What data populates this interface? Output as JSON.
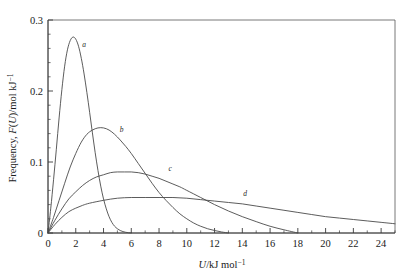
{
  "chart_data": {
    "type": "line",
    "title": "",
    "xlabel": "U/kJ mol⁻¹",
    "ylabel": "Frequency, F(U)/mol kJ⁻¹",
    "xlim": [
      0,
      25
    ],
    "ylim": [
      0,
      0.3
    ],
    "grid": false,
    "legend_position": "inline-curve-labels",
    "x_ticks": [
      0,
      2,
      4,
      6,
      8,
      10,
      12,
      14,
      16,
      18,
      20,
      22,
      24
    ],
    "x_tick_labels": [
      "0",
      "2",
      "4",
      "6",
      "8",
      "10",
      "12",
      "14",
      "16",
      "18",
      "20",
      "22",
      "24"
    ],
    "x_minor_tick_step": 1,
    "y_ticks": [
      0,
      0.1,
      0.2,
      0.3
    ],
    "y_tick_labels": [
      "0",
      "0.1",
      "0.2",
      "0.3"
    ],
    "y_minor_tick_step": 0.02,
    "series": [
      {
        "name": "a",
        "label": "a",
        "label_x": 2.6,
        "label_y": 0.262,
        "peak_x": 1.8,
        "peak_y": 0.276,
        "x": [
          0,
          0.2,
          0.4,
          0.6,
          0.8,
          1.0,
          1.2,
          1.4,
          1.6,
          1.8,
          2.0,
          2.2,
          2.4,
          2.6,
          2.8,
          3.0,
          3.2,
          3.4,
          3.6,
          3.8,
          4.0,
          4.2,
          4.4,
          4.6,
          4.8,
          5.0,
          5.2,
          5.4,
          5.6,
          5.8,
          6.0
        ],
        "y": [
          0.0,
          0.035,
          0.075,
          0.118,
          0.162,
          0.202,
          0.235,
          0.258,
          0.271,
          0.276,
          0.273,
          0.263,
          0.246,
          0.224,
          0.198,
          0.17,
          0.141,
          0.113,
          0.088,
          0.066,
          0.048,
          0.034,
          0.023,
          0.015,
          0.0095,
          0.006,
          0.0035,
          0.002,
          0.001,
          0.0004,
          0.0
        ]
      },
      {
        "name": "b",
        "label": "b",
        "label_x": 5.3,
        "label_y": 0.142,
        "peak_x": 4.0,
        "peak_y": 0.148,
        "x": [
          0,
          0.4,
          0.8,
          1.2,
          1.6,
          2.0,
          2.4,
          2.8,
          3.2,
          3.6,
          4.0,
          4.4,
          4.8,
          5.2,
          5.6,
          6.0,
          6.5,
          7.0,
          7.5,
          8.0,
          8.5,
          9.0,
          9.5,
          10.0,
          10.5,
          11.0,
          11.5,
          12.0,
          12.5,
          13.0
        ],
        "y": [
          0.0,
          0.022,
          0.046,
          0.07,
          0.093,
          0.112,
          0.128,
          0.139,
          0.145,
          0.148,
          0.148,
          0.145,
          0.139,
          0.131,
          0.122,
          0.112,
          0.098,
          0.084,
          0.07,
          0.057,
          0.046,
          0.036,
          0.027,
          0.02,
          0.014,
          0.0095,
          0.006,
          0.0035,
          0.0015,
          0.0
        ]
      },
      {
        "name": "c",
        "label": "c",
        "label_x": 8.8,
        "label_y": 0.088,
        "peak_x": 6.2,
        "peak_y": 0.086,
        "x": [
          0,
          0.5,
          1.0,
          1.5,
          2.0,
          2.5,
          3.0,
          3.5,
          4.0,
          4.5,
          5.0,
          5.5,
          6.0,
          6.5,
          7.0,
          7.5,
          8.0,
          8.5,
          9.0,
          9.5,
          10.0,
          11.0,
          12.0,
          13.0,
          14.0,
          15.0,
          16.0,
          17.0,
          18.0
        ],
        "y": [
          0.0,
          0.018,
          0.034,
          0.048,
          0.058,
          0.067,
          0.074,
          0.079,
          0.082,
          0.085,
          0.086,
          0.086,
          0.086,
          0.085,
          0.083,
          0.08,
          0.077,
          0.073,
          0.069,
          0.065,
          0.06,
          0.05,
          0.04,
          0.031,
          0.023,
          0.016,
          0.0095,
          0.0045,
          0.0
        ]
      },
      {
        "name": "d",
        "label": "d",
        "label_x": 14.2,
        "label_y": 0.052,
        "peak_x": 9.0,
        "peak_y": 0.05,
        "x": [
          0,
          0.5,
          1.0,
          1.5,
          2.0,
          2.5,
          3.0,
          4.0,
          5.0,
          6.0,
          7.0,
          8.0,
          9.0,
          10.0,
          11.0,
          12.0,
          13.0,
          14.0,
          15.0,
          16.0,
          17.0,
          18.0,
          19.0,
          20.0,
          21.0,
          22.0,
          23.0,
          24.0,
          25.0
        ],
        "y": [
          0.0,
          0.012,
          0.022,
          0.03,
          0.035,
          0.039,
          0.042,
          0.046,
          0.049,
          0.05,
          0.05,
          0.05,
          0.05,
          0.049,
          0.047,
          0.045,
          0.043,
          0.041,
          0.038,
          0.035,
          0.032,
          0.029,
          0.026,
          0.023,
          0.021,
          0.019,
          0.017,
          0.015,
          0.013
        ]
      }
    ]
  },
  "axes": {
    "x_axis_label_main": "U",
    "x_axis_label_rest": "/kJ mol",
    "x_axis_label_sup": "−1",
    "y_axis_label_lead": "Frequency, ",
    "y_axis_label_ital": "F",
    "y_axis_label_paren_open": "(",
    "y_axis_label_var": "U",
    "y_axis_label_paren_close": ")",
    "y_axis_label_rest": "/mol kJ",
    "y_axis_label_sup": "−1"
  },
  "colors": {
    "curve": "#4a4a4a",
    "axis": "#3a3a3a",
    "text": "#1a1a1a",
    "background": "#ffffff"
  }
}
